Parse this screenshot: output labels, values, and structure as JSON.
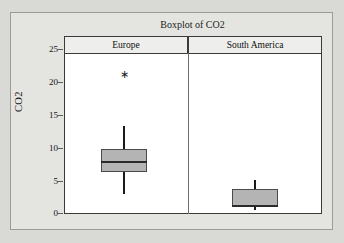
{
  "chart_data": {
    "type": "box",
    "title": "Boxplot of CO2",
    "xlabel": "",
    "ylabel": "CO2",
    "ylim": [
      0,
      26
    ],
    "yticks": [
      0,
      5,
      10,
      15,
      20,
      25
    ],
    "ytick_labels": [
      "0",
      "5",
      "10",
      "15",
      "20",
      "25"
    ],
    "grid": false,
    "legend": "none",
    "panels": [
      {
        "label": "Europe",
        "min_whisker": 2.9,
        "q1": 6.2,
        "median": 7.7,
        "q3": 9.7,
        "max_whisker": 13.2,
        "outliers": [
          21.5
        ]
      },
      {
        "label": "South America",
        "min_whisker": 0.5,
        "q1": 0.9,
        "median": 1.1,
        "q3": 3.6,
        "max_whisker": 5.0,
        "outliers": []
      }
    ]
  },
  "figure": {
    "title": "Boxplot of CO2",
    "y_axis_title": "CO2",
    "y_tick_labels": [
      "25",
      "20",
      "15",
      "10",
      "5",
      "0"
    ],
    "panel_headers": [
      "Europe",
      "South America"
    ],
    "outlier_glyph": "∗",
    "colors": {
      "page_background": "#d9d9d6",
      "figure_background": "#e4e4e1",
      "plot_background": "#ffffff",
      "box_fill": "#b4b4b4",
      "line": "#1a1a1a"
    }
  }
}
